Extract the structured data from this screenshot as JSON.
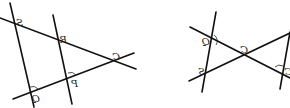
{
  "figures": [
    {
      "id": "left-figure",
      "labels": {
        "S": "S",
        "R": "R",
        "C": "C",
        "P": "P",
        "Q": "Q"
      },
      "mirrored": true
    },
    {
      "id": "right-figure",
      "labels": {
        "Q": "Q",
        "C": "C",
        "S": "S",
        "right_vertex": "C"
      },
      "mirrored": true
    }
  ],
  "colors": {
    "line": "#111111",
    "background": "#ffffff"
  }
}
